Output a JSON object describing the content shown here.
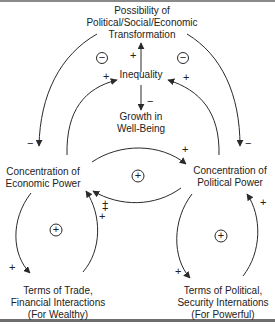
{
  "diagram": {
    "nodes": {
      "transformation": [
        "Possibility of",
        "Political/Social/Economic",
        "Transformation"
      ],
      "inequality": "Inequality",
      "growth": [
        "Growth in",
        "Well-Being"
      ],
      "economic_power": [
        "Concentration of",
        "Economic Power"
      ],
      "political_power": [
        "Concentration of",
        "Political Power"
      ],
      "terms_trade": [
        "Terms of Trade,",
        "Financial Interactions",
        "(For Wealthy)"
      ],
      "terms_political": [
        "Terms of Political,",
        "Security Internations",
        "(For Powerful)"
      ]
    },
    "signs": {
      "ineq_to_transform": "+",
      "ineq_to_growth": "−",
      "econ_to_ineq": "+",
      "pol_to_ineq": "+",
      "transform_to_econ": "−",
      "transform_to_pol": "−",
      "econ_to_pol": "+",
      "pol_to_econ": "+",
      "econ_to_trade": "+",
      "trade_to_econ_a": "+",
      "trade_to_econ_b": "+",
      "pol_to_terms": "+",
      "terms_to_pol": "+"
    },
    "loop_markers": {
      "left_top": "−",
      "right_top": "−",
      "center": "+",
      "bottom_left": "+",
      "bottom_right": "+"
    },
    "colors": {
      "line": "#2a2a2a",
      "text": "#222222",
      "border": "#7a7a7a"
    }
  }
}
